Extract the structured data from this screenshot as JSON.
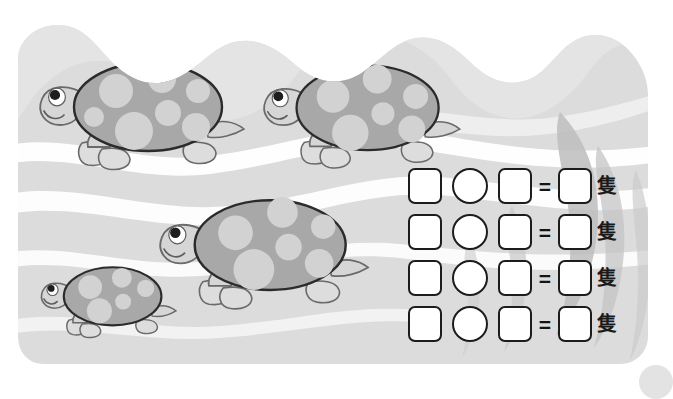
{
  "worksheet": {
    "title": "Turtle counting worksheet",
    "theme": "underwater-turtles",
    "turtle_count": 4,
    "equation_rows": [
      {
        "box1": "",
        "operator_shape": "circle",
        "box2": "",
        "equals": "=",
        "answer": "",
        "unit": "隻"
      },
      {
        "box1": "",
        "operator_shape": "circle",
        "box2": "",
        "equals": "=",
        "answer": "",
        "unit": "隻"
      },
      {
        "box1": "",
        "operator_shape": "circle",
        "box2": "",
        "equals": "=",
        "answer": "",
        "unit": "隻"
      },
      {
        "box1": "",
        "operator_shape": "circle",
        "box2": "",
        "equals": "=",
        "answer": "",
        "unit": "隻"
      }
    ]
  },
  "turtles": [
    {
      "label": "turtle-1",
      "size": "large",
      "x": 38,
      "y": 55,
      "scale": 1.0
    },
    {
      "label": "turtle-2",
      "size": "large",
      "x": 262,
      "y": 58,
      "scale": 0.96
    },
    {
      "label": "turtle-3",
      "size": "large",
      "x": 158,
      "y": 192,
      "scale": 1.02
    },
    {
      "label": "turtle-4",
      "size": "small",
      "x": 40,
      "y": 262,
      "scale": 0.66
    }
  ],
  "colors": {
    "panel_background": "#dcdcdc",
    "wave_white": "#ffffff",
    "kelp_gray": "#b9b9b9",
    "shell_base": "#a8a8a8",
    "shell_spot": "#d2d2d2",
    "body_gray": "#d6d6d6",
    "outline": "#5e5e5e",
    "shell_outline": "#2b2b2b",
    "box_outline": "#1c1c1c",
    "text_black": "#1a1a1a",
    "page_white": "#ffffff",
    "corner_dot": "#e3e3e3"
  }
}
